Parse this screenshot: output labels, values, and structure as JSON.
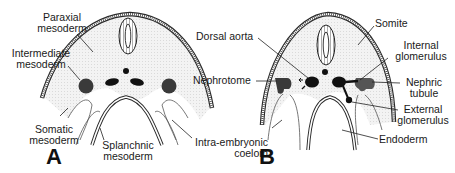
{
  "figure": {
    "panels": [
      {
        "id": "A",
        "label": "A",
        "labels": {
          "paraxial_1": "Paraxial",
          "paraxial_2": "mesoderm",
          "intermediate_1": "Intermediate",
          "intermediate_2": "mesoderm",
          "somatic_1": "Somatic",
          "somatic_2": "mesoderm",
          "splanchnic_1": "Splanchnic",
          "splanchnic_2": "mesoderm",
          "intra_1": "Intra-embryonic",
          "intra_2": "coelom"
        }
      },
      {
        "id": "B",
        "label": "B",
        "labels": {
          "dorsal_aorta": "Dorsal aorta",
          "nephrotome": "Nephrotome",
          "somite": "Somite",
          "internal_1": "Internal",
          "internal_2": "glomerulus",
          "nephric_1": "Nephric",
          "nephric_2": "tubule",
          "external_1": "External",
          "external_2": "glomerulus",
          "endoderm": "Endoderm"
        }
      }
    ],
    "colors": {
      "line": "#2a2a2a",
      "fill_light": "#ececec",
      "fill_dark": "#3a3a3a",
      "black": "#111111"
    }
  }
}
